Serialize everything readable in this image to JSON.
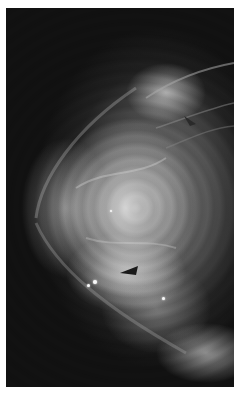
{
  "image": {
    "subject": "mammogram",
    "description": "Grayscale breast radiograph with dense fibroglandular tissue on a black background, white border",
    "colors": {
      "background": "#111111",
      "border": "#ffffff",
      "tissue_bright": "#e6e6e6",
      "tissue_mid": "#969696",
      "marker": "#1a1a1a"
    },
    "markers": [
      {
        "name": "arrowhead-lower",
        "x": 128,
        "y": 270,
        "direction": "left"
      },
      {
        "name": "arrowhead-upper",
        "x": 188,
        "y": 118,
        "direction": "down-left"
      }
    ],
    "calcifications": [
      {
        "x": 93,
        "y": 280
      },
      {
        "x": 87,
        "y": 284
      },
      {
        "x": 162,
        "y": 297
      },
      {
        "x": 110,
        "y": 210
      }
    ]
  }
}
